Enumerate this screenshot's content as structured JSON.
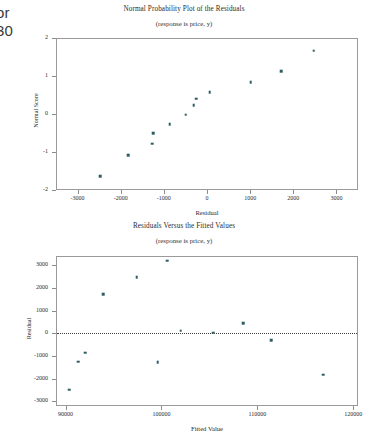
{
  "page": {
    "margin_text_line1": "or",
    "margin_text_line2": "30"
  },
  "chart_data": [
    {
      "id": "normal-probability-plot",
      "type": "scatter",
      "title": "Normal Probability Plot of the Residuals",
      "subtitle": "(response is price, y)",
      "xlabel": "Residual",
      "ylabel": "Normal Score",
      "xlim": [
        -3500,
        3500
      ],
      "ylim": [
        -2,
        2
      ],
      "xticks": [
        -3000,
        -2000,
        -1000,
        0,
        1000,
        2000,
        3000
      ],
      "xtick_labels": [
        "-3000",
        "-2000",
        "-1000",
        "0",
        "1000",
        "2000",
        "3000"
      ],
      "yticks": [
        -2,
        -1,
        0,
        1,
        2
      ],
      "ytick_labels": [
        "-2",
        "-1",
        "0",
        "1",
        "2"
      ],
      "grid": false,
      "legend": "none",
      "marker_color": "#2e5c63",
      "points": [
        {
          "x": -2480,
          "y": -1.63
        },
        {
          "x": -1820,
          "y": -1.09
        },
        {
          "x": -1265,
          "y": -0.78
        },
        {
          "x": -1245,
          "y": -0.5
        },
        {
          "x": -860,
          "y": -0.27
        },
        {
          "x": -490,
          "y": -0.02
        },
        {
          "x": -305,
          "y": 0.23
        },
        {
          "x": -255,
          "y": 0.4
        },
        {
          "x": 60,
          "y": 0.58
        },
        {
          "x": 1010,
          "y": 0.83
        },
        {
          "x": 1720,
          "y": 1.12
        },
        {
          "x": 2470,
          "y": 1.67
        }
      ]
    },
    {
      "id": "residuals-versus-fitted-values",
      "type": "scatter",
      "title": "Residuals Versus the Fitted Values",
      "subtitle": "(response is price, y)",
      "xlabel": "Fitted Value",
      "ylabel": "Residual",
      "xlim": [
        89000,
        120500
      ],
      "ylim": [
        -3200,
        3400
      ],
      "xticks": [
        90000,
        100000,
        110000,
        120000
      ],
      "xtick_labels": [
        "90000",
        "100000",
        "110000",
        "120000"
      ],
      "yticks": [
        3000,
        2000,
        1000,
        0,
        -1000,
        -2000,
        -3000
      ],
      "ytick_labels": [
        "3000",
        "2000",
        "1000",
        "0",
        "-1000",
        "-2000",
        "-3000"
      ],
      "grid": false,
      "legend": "none",
      "marker_color": "#2e5c63",
      "reference_line": {
        "y": 0,
        "style": "dotted"
      },
      "points": [
        {
          "x": 90380,
          "y": -2480
        },
        {
          "x": 91320,
          "y": -1245
        },
        {
          "x": 92060,
          "y": -860
        },
        {
          "x": 93940,
          "y": 1720
        },
        {
          "x": 97420,
          "y": 2470
        },
        {
          "x": 99600,
          "y": -1265
        },
        {
          "x": 100620,
          "y": 3190
        },
        {
          "x": 102020,
          "y": 120
        },
        {
          "x": 105380,
          "y": 30
        },
        {
          "x": 108540,
          "y": 450
        },
        {
          "x": 111420,
          "y": -305
        },
        {
          "x": 116900,
          "y": -1820
        }
      ]
    }
  ]
}
